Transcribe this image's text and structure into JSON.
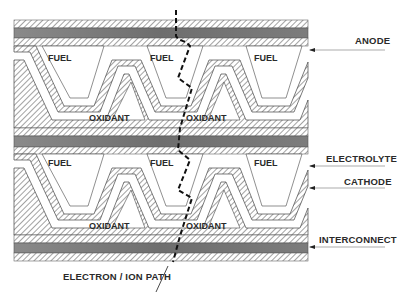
{
  "diagram": {
    "channels": {
      "fuel": "FUEL",
      "oxidant": "OXIDANT"
    },
    "callouts": {
      "anode": "ANODE",
      "electrolyte": "ELECTROLYTE",
      "cathode": "CATHODE",
      "interconnect": "INTERCONNECT",
      "path": "ELECTRON / ION PATH"
    },
    "colors": {
      "interconnect_fill": "#7a7a7a",
      "hatch_line": "#555555",
      "text": "#2a2a2a",
      "background": "#ffffff"
    }
  }
}
